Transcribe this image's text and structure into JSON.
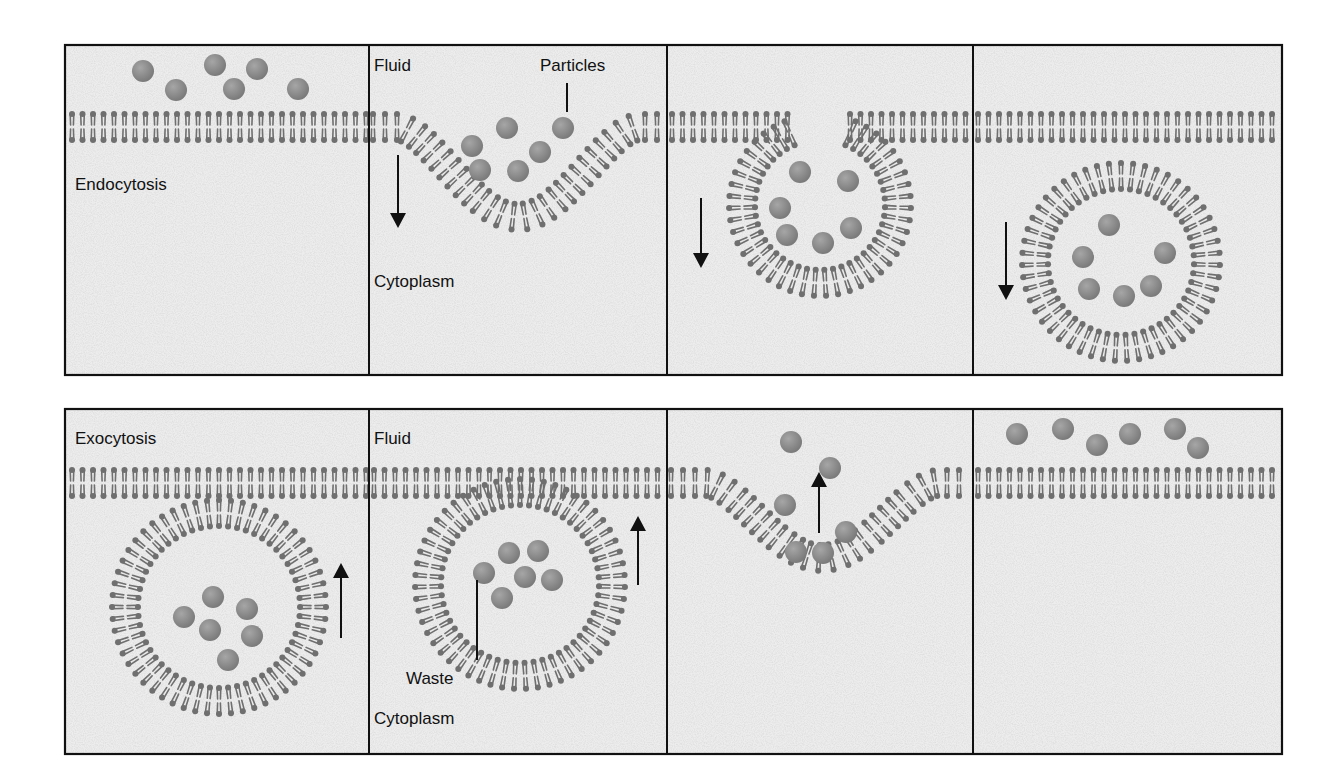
{
  "diagram": {
    "colors": {
      "panel_bg": "#ededed",
      "panel_border": "#111111",
      "lipid": "#6f6f6f",
      "particle": "#8c8c8c",
      "arrow": "#111111",
      "text": "#111111"
    },
    "rows": [
      {
        "name": "endocytosis",
        "frame": {
          "x": 65,
          "y": 45,
          "w": 1217,
          "h": 330
        },
        "dividers": [
          369,
          667,
          973
        ],
        "panels": [
          {
            "step": 1,
            "labels": [
              {
                "text": "Endocytosis",
                "x": 75,
                "y": 190
              }
            ],
            "membrane": [
              {
                "type": "flat",
                "x1": 67,
                "x2": 369,
                "y": 127
              }
            ],
            "particles": [
              [
                143,
                71
              ],
              [
                176,
                90
              ],
              [
                215,
                65
              ],
              [
                234,
                89
              ],
              [
                257,
                69
              ],
              [
                298,
                89
              ]
            ],
            "arrows": []
          },
          {
            "step": 2,
            "labels": [
              {
                "text": "Fluid",
                "x": 374,
                "y": 71
              },
              {
                "text": "Particles",
                "x": 540,
                "y": 71
              },
              {
                "text": "Cytoplasm",
                "x": 374,
                "y": 287
              }
            ],
            "pointers": [
              {
                "x1": 567,
                "y1": 83,
                "x2": 567,
                "y2": 112
              }
            ],
            "membrane": [
              {
                "type": "pit",
                "x1": 369,
                "x2": 667,
                "y": 127,
                "cx": 518,
                "depth": 90,
                "halfwidth": 120
              }
            ],
            "particles": [
              [
                507,
                128
              ],
              [
                472,
                146
              ],
              [
                563,
                128
              ],
              [
                540,
                152
              ],
              [
                480,
                170
              ],
              [
                518,
                171
              ]
            ],
            "arrows": [
              {
                "x": 398,
                "y1": 155,
                "y2": 228,
                "dir": "down"
              }
            ]
          },
          {
            "step": 3,
            "labels": [],
            "membrane": [
              {
                "type": "flat",
                "x1": 667,
                "x2": 790,
                "y": 127
              },
              {
                "type": "flat",
                "x1": 845,
                "x2": 973,
                "y": 127
              },
              {
                "type": "ring",
                "cx": 820,
                "cy": 205,
                "r": 78,
                "gap_deg": 40
              }
            ],
            "particles": [
              [
                800,
                172
              ],
              [
                848,
                181
              ],
              [
                780,
                208
              ],
              [
                787,
                235
              ],
              [
                823,
                243
              ],
              [
                851,
                228
              ]
            ],
            "arrows": [
              {
                "x": 701,
                "y1": 198,
                "y2": 268,
                "dir": "down"
              }
            ]
          },
          {
            "step": 4,
            "labels": [],
            "membrane": [
              {
                "type": "flat",
                "x1": 973,
                "x2": 1282,
                "y": 127
              },
              {
                "type": "ring",
                "cx": 1121,
                "cy": 262,
                "r": 86,
                "gap_deg": 0
              }
            ],
            "particles": [
              [
                1109,
                225
              ],
              [
                1083,
                257
              ],
              [
                1165,
                253
              ],
              [
                1089,
                289
              ],
              [
                1124,
                296
              ],
              [
                1151,
                286
              ]
            ],
            "arrows": [
              {
                "x": 1006,
                "y1": 222,
                "y2": 300,
                "dir": "down"
              }
            ]
          }
        ]
      },
      {
        "name": "exocytosis",
        "frame": {
          "x": 65,
          "y": 409,
          "w": 1217,
          "h": 345
        },
        "dividers": [
          369,
          667,
          973
        ],
        "panels": [
          {
            "step": 1,
            "labels": [
              {
                "text": "Exocytosis",
                "x": 75,
                "y": 444
              }
            ],
            "membrane": [
              {
                "type": "flat",
                "x1": 67,
                "x2": 369,
                "y": 483
              },
              {
                "type": "ring",
                "cx": 219,
                "cy": 607,
                "r": 94,
                "gap_deg": 0
              }
            ],
            "particles": [
              [
                213,
                597
              ],
              [
                247,
                609
              ],
              [
                184,
                617
              ],
              [
                210,
                630
              ],
              [
                252,
                636
              ],
              [
                228,
                660
              ]
            ],
            "arrows": [
              {
                "x": 341,
                "y1": 638,
                "y2": 563,
                "dir": "up"
              }
            ]
          },
          {
            "step": 2,
            "labels": [
              {
                "text": "Fluid",
                "x": 374,
                "y": 444
              },
              {
                "text": "Waste",
                "x": 406,
                "y": 684
              },
              {
                "text": "Cytoplasm",
                "x": 374,
                "y": 724
              }
            ],
            "pointers": [
              {
                "x1": 477,
                "y1": 580,
                "x2": 477,
                "y2": 660
              }
            ],
            "membrane": [
              {
                "type": "flat",
                "x1": 369,
                "x2": 667,
                "y": 483
              },
              {
                "type": "ring",
                "cx": 520,
                "cy": 584,
                "r": 92,
                "gap_deg": 0
              }
            ],
            "particles": [
              [
                509,
                553
              ],
              [
                538,
                551
              ],
              [
                484,
                573
              ],
              [
                525,
                577
              ],
              [
                552,
                580
              ],
              [
                502,
                598
              ]
            ],
            "arrows": [
              {
                "x": 638,
                "y1": 585,
                "y2": 516,
                "dir": "up"
              }
            ]
          },
          {
            "step": 3,
            "labels": [],
            "membrane": [
              {
                "type": "pit",
                "x1": 667,
                "x2": 973,
                "y": 483,
                "cx": 822,
                "depth": 75,
                "halfwidth": 115
              }
            ],
            "particles": [
              [
                791,
                442
              ],
              [
                830,
                468
              ],
              [
                785,
                505
              ],
              [
                846,
                532
              ],
              [
                796,
                552
              ],
              [
                823,
                553
              ]
            ],
            "arrows": [
              {
                "x": 819,
                "y1": 533,
                "y2": 472,
                "dir": "up"
              }
            ]
          },
          {
            "step": 4,
            "labels": [],
            "membrane": [
              {
                "type": "flat",
                "x1": 973,
                "x2": 1282,
                "y": 483
              }
            ],
            "particles": [
              [
                1017,
                434
              ],
              [
                1063,
                429
              ],
              [
                1097,
                445
              ],
              [
                1130,
                434
              ],
              [
                1175,
                429
              ],
              [
                1198,
                448
              ]
            ],
            "arrows": []
          }
        ]
      }
    ]
  }
}
